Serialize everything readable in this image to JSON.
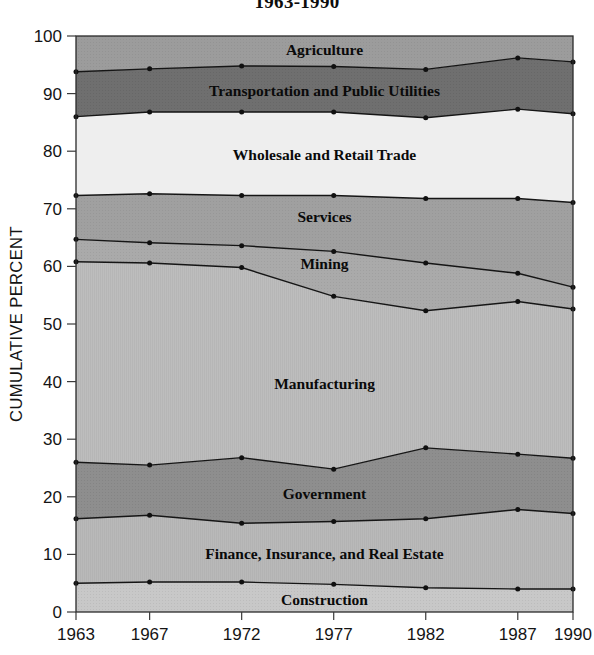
{
  "chart": {
    "title": "1963-1990",
    "ylabel": "CUMULATIVE PERCENT",
    "xlabel": ""
  },
  "axis": {
    "y_ticks": [
      "0",
      "10",
      "20",
      "30",
      "40",
      "50",
      "60",
      "70",
      "80",
      "90",
      "100"
    ],
    "x_ticks": [
      "1963",
      "1967",
      "1972",
      "1977",
      "1982",
      "1987",
      "1990"
    ]
  },
  "labels": {
    "agriculture": "Agriculture",
    "transportation": "Transportation and Public Utilities",
    "wholesale": "Wholesale and Retail Trade",
    "services": "Services",
    "mining": "Mining",
    "manufacturing": "Manufacturing",
    "government": "Government",
    "finance": "Finance, Insurance, and Real Estate",
    "construction": "Construction"
  },
  "colors": {
    "agriculture": "#9c9c9c",
    "transportation": "#6f6f6f",
    "wholesale": "#eeeeee",
    "services": "#a0a0a0",
    "mining": "#aaaaaa",
    "manufacturing": "#bdbdbd",
    "government": "#8e8e8e",
    "finance": "#b9b9b9",
    "construction": "#c8c8c8",
    "line": "#151515",
    "axis": "#2a2a2a",
    "background": "#ffffff"
  },
  "chart_data": {
    "type": "area",
    "title": "1963-1990",
    "xlabel": "",
    "ylabel": "CUMULATIVE PERCENT",
    "ylim": [
      0,
      100
    ],
    "grid": false,
    "legend": "inline-band-labels",
    "stacked": true,
    "cumulative": true,
    "x": [
      1963,
      1967,
      1972,
      1977,
      1982,
      1987,
      1990
    ],
    "x_positions": [
      0,
      4,
      9,
      14,
      19,
      24,
      27
    ],
    "cumulative_series": [
      {
        "name": "Construction",
        "values": [
          5.0,
          5.2,
          5.2,
          4.8,
          4.2,
          4.0,
          4.0
        ]
      },
      {
        "name": "Finance, Insurance, and Real Estate",
        "values": [
          16.2,
          16.8,
          15.4,
          15.7,
          16.2,
          17.8,
          17.1
        ]
      },
      {
        "name": "Government",
        "values": [
          26.0,
          25.5,
          26.8,
          24.8,
          28.5,
          27.4,
          26.7
        ]
      },
      {
        "name": "Manufacturing",
        "values": [
          60.8,
          60.6,
          59.8,
          54.8,
          52.3,
          53.9,
          52.6
        ]
      },
      {
        "name": "Mining",
        "values": [
          64.7,
          64.1,
          63.6,
          62.6,
          60.6,
          58.8,
          56.4
        ]
      },
      {
        "name": "Services",
        "values": [
          72.3,
          72.6,
          72.3,
          72.3,
          71.8,
          71.8,
          71.1
        ]
      },
      {
        "name": "Wholesale and Retail Trade",
        "values": [
          86.0,
          86.8,
          86.8,
          86.8,
          85.8,
          87.3,
          86.5
        ]
      },
      {
        "name": "Transportation and Public Utilities",
        "values": [
          93.8,
          94.3,
          94.8,
          94.7,
          94.2,
          96.2,
          95.5
        ]
      },
      {
        "name": "Agriculture",
        "values": [
          100,
          100,
          100,
          100,
          100,
          100,
          100
        ]
      }
    ],
    "band_values": [
      {
        "name": "Construction",
        "values": [
          5.0,
          5.2,
          5.2,
          4.8,
          4.2,
          4.0,
          4.0
        ]
      },
      {
        "name": "Finance, Insurance, and Real Estate",
        "values": [
          11.2,
          11.6,
          10.2,
          10.9,
          12.0,
          13.8,
          13.1
        ]
      },
      {
        "name": "Government",
        "values": [
          9.8,
          8.7,
          11.4,
          9.1,
          12.3,
          9.6,
          9.6
        ]
      },
      {
        "name": "Manufacturing",
        "values": [
          34.8,
          35.1,
          33.0,
          30.0,
          23.8,
          26.5,
          25.9
        ]
      },
      {
        "name": "Mining",
        "values": [
          3.9,
          3.5,
          3.8,
          7.8,
          8.3,
          4.9,
          3.8
        ]
      },
      {
        "name": "Services",
        "values": [
          7.6,
          8.5,
          8.7,
          9.7,
          11.2,
          13.0,
          14.7
        ]
      },
      {
        "name": "Wholesale and Retail Trade",
        "values": [
          13.7,
          14.2,
          14.5,
          14.5,
          14.0,
          15.5,
          15.4
        ]
      },
      {
        "name": "Transportation and Public Utilities",
        "values": [
          7.8,
          7.5,
          8.0,
          7.9,
          8.4,
          8.9,
          9.0
        ]
      },
      {
        "name": "Agriculture",
        "values": [
          6.2,
          5.7,
          5.2,
          5.3,
          5.8,
          3.8,
          4.5
        ]
      }
    ]
  }
}
